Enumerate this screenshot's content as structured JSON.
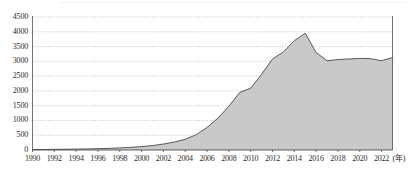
{
  "chart_data": {
    "type": "area",
    "title": "",
    "xlabel": "(年)",
    "ylabel": "",
    "ylim": [
      0,
      4500
    ],
    "xlim": [
      1990,
      2023
    ],
    "grid": true,
    "legend": null,
    "y_ticks": [
      "0",
      "500",
      "1000",
      "1500",
      "2000",
      "2500",
      "3000",
      "3500",
      "4000",
      "4500"
    ],
    "y_tick_values": [
      0,
      500,
      1000,
      1500,
      2000,
      2500,
      3000,
      3500,
      4000,
      4500
    ],
    "x_ticks": [
      "1990",
      "1992",
      "1994",
      "1996",
      "1998",
      "2000",
      "2002",
      "2004",
      "2006",
      "2008",
      "2010",
      "2012",
      "2014",
      "2016",
      "2018",
      "2020",
      "2022"
    ],
    "x_tick_values": [
      1990,
      1992,
      1994,
      1996,
      1998,
      2000,
      2002,
      2004,
      2006,
      2008,
      2010,
      2012,
      2014,
      2016,
      2018,
      2020,
      2022
    ],
    "x_unit_label": "(年)",
    "series": [
      {
        "name": "series-1",
        "fill_color": "#c9c9c9",
        "line_color": "#4a4a4a",
        "x": [
          1990,
          1991,
          1992,
          1993,
          1994,
          1995,
          1996,
          1997,
          1998,
          1999,
          2000,
          2001,
          2002,
          2003,
          2004,
          2005,
          2006,
          2007,
          2008,
          2009,
          2010,
          2011,
          2012,
          2013,
          2014,
          2015,
          2016,
          2017,
          2018,
          2019,
          2020,
          2021,
          2022,
          2023
        ],
        "values": [
          15,
          18,
          22,
          26,
          30,
          36,
          44,
          55,
          70,
          90,
          115,
          150,
          200,
          270,
          360,
          520,
          760,
          1080,
          1480,
          1950,
          2090,
          2560,
          3080,
          3320,
          3700,
          3950,
          3300,
          3020,
          3060,
          3080,
          3100,
          3090,
          3020,
          3130
        ]
      }
    ],
    "annotations": {
      "peak_year": 2015,
      "peak_value": 3950
    }
  },
  "axis_style": {
    "gridline_color": "#9a9a9a",
    "axis_color": "#3a3a3a",
    "tick_font_px": 8
  }
}
